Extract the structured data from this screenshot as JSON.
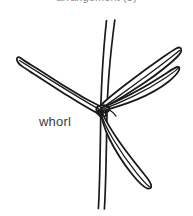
{
  "figure": {
    "background_color": "#ffffff",
    "ink_color": "#1a1a1a",
    "width": 193,
    "height": 216,
    "caption_top": "arrangement (3)",
    "caption_top_color": "#8c8c8c",
    "label_whorl": "whorl",
    "label_whorl_color": "#3d3d3d",
    "parts": {
      "stem_name": "stem",
      "node_name": "node",
      "leaf_upper_left": "leaf",
      "leaf_upper_right": "leaf",
      "leaf_mid_right": "leaf",
      "leaf_lower_right": "leaf"
    }
  }
}
